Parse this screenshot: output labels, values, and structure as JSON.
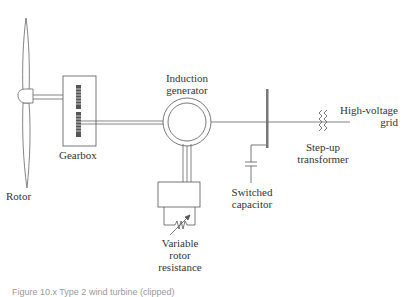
{
  "diagram": {
    "labels": {
      "rotor": "Rotor",
      "gearbox": "Gearbox",
      "generator_line1": "Induction",
      "generator_line2": "generator",
      "resistance_line1": "Variable",
      "resistance_line2": "rotor",
      "resistance_line3": "resistance",
      "capacitor_line1": "Switched",
      "capacitor_line2": "capacitor",
      "transformer_line1": "Step-up",
      "transformer_line2": "transformer",
      "grid_line1": "High-voltage",
      "grid_line2": "grid"
    },
    "caption": "Figure 10.x  Type 2 wind turbine (clipped)",
    "colors": {
      "stroke": "#555555",
      "bus": "#777777",
      "gear": "#555555",
      "text": "#333333"
    },
    "nodes": [
      {
        "id": "rotor",
        "label": "Rotor"
      },
      {
        "id": "gearbox",
        "label": "Gearbox"
      },
      {
        "id": "induction-generator",
        "label": "Induction generator"
      },
      {
        "id": "variable-rotor-resistance",
        "label": "Variable rotor resistance"
      },
      {
        "id": "bus",
        "label": ""
      },
      {
        "id": "switched-capacitor",
        "label": "Switched capacitor"
      },
      {
        "id": "step-up-transformer",
        "label": "Step-up transformer"
      },
      {
        "id": "grid",
        "label": "High-voltage grid"
      }
    ],
    "edges": [
      {
        "from": "rotor",
        "to": "gearbox",
        "type": "shaft"
      },
      {
        "from": "gearbox",
        "to": "induction-generator",
        "type": "shaft"
      },
      {
        "from": "induction-generator",
        "to": "variable-rotor-resistance",
        "type": "rotor-circuit"
      },
      {
        "from": "induction-generator",
        "to": "bus",
        "type": "line"
      },
      {
        "from": "bus",
        "to": "switched-capacitor",
        "type": "line"
      },
      {
        "from": "bus",
        "to": "step-up-transformer",
        "type": "line"
      },
      {
        "from": "step-up-transformer",
        "to": "grid",
        "type": "line"
      }
    ]
  }
}
